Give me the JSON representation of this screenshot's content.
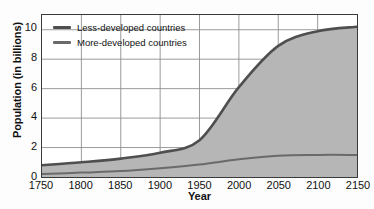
{
  "chart_data": {
    "type": "area",
    "title": "",
    "xlabel": "Year",
    "ylabel": "Population (in billions)",
    "xlim": [
      1750,
      2150
    ],
    "ylim": [
      0,
      11
    ],
    "xticks": [
      1750,
      1800,
      1850,
      1900,
      1950,
      2000,
      2050,
      2100,
      2150
    ],
    "yticks": [
      0,
      2,
      4,
      6,
      8,
      10
    ],
    "grid": true,
    "stacked": true,
    "legend_position": "top-left",
    "x": [
      1750,
      1800,
      1850,
      1900,
      1950,
      2000,
      2050,
      2100,
      2150
    ],
    "series": [
      {
        "name": "More-developed countries",
        "color": "#6a6a6a",
        "values": [
          0.2,
          0.3,
          0.4,
          0.6,
          0.85,
          1.2,
          1.45,
          1.5,
          1.5
        ]
      },
      {
        "name": "Less-developed countries",
        "color": "#4f4f4f",
        "note": "upper boundary is total world population",
        "total_values": [
          0.8,
          1.0,
          1.25,
          1.65,
          2.5,
          6.1,
          8.9,
          9.9,
          10.2
        ],
        "values": [
          0.6,
          0.7,
          0.85,
          1.05,
          1.65,
          4.9,
          7.45,
          8.4,
          8.7
        ]
      }
    ],
    "fill_color": "#b6b6b6",
    "axis_color": "#3a3a3a",
    "grid_color": "#8e8e8e"
  },
  "legend": {
    "items": [
      {
        "label": "Less-developed countries",
        "color": "#4f4f4f"
      },
      {
        "label": "More-developed countries",
        "color": "#6a6a6a"
      }
    ]
  },
  "axes": {
    "y_title": "Population (in billions)",
    "x_title": "Year",
    "y_tick_labels": [
      "10",
      "8",
      "6",
      "4",
      "2",
      "0"
    ],
    "x_tick_labels": [
      "1750",
      "1800",
      "1850",
      "1900",
      "1950",
      "2000",
      "2050",
      "2100",
      "2150"
    ]
  }
}
